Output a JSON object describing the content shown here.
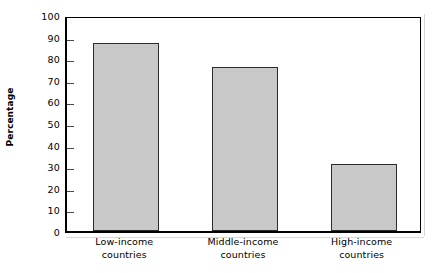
{
  "chart_data": {
    "type": "bar",
    "title": "",
    "xlabel": "",
    "ylabel": "Percentage",
    "ylim": [
      0,
      100
    ],
    "yticks": [
      0,
      10,
      20,
      30,
      40,
      50,
      60,
      70,
      80,
      90,
      100
    ],
    "ytick_labels": [
      "0",
      "10",
      "20",
      "30",
      "40",
      "50",
      "60",
      "70",
      "80",
      "90",
      "100"
    ],
    "grid": false,
    "legend": null,
    "categories": [
      "Low-income countries",
      "Middle-income countries",
      "High-income countries"
    ],
    "category_lines": [
      [
        "Low-income",
        "countries"
      ],
      [
        "Middle-income",
        "countries"
      ],
      [
        "High-income",
        "countries"
      ]
    ],
    "values": [
      87,
      76,
      31
    ],
    "series": [
      {
        "name": "Percentage",
        "values": [
          87,
          76,
          31
        ]
      }
    ],
    "colors": {
      "bar_fill": "#c9c9c9",
      "bar_border": "#2b2b2b",
      "axis": "#000000",
      "text": "#000000",
      "background": "#ffffff"
    }
  },
  "axis": {
    "y_title": "Percentage"
  }
}
